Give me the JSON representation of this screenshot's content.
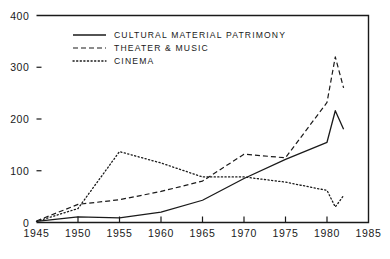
{
  "chart_data": {
    "type": "line",
    "title": "",
    "xlabel": "",
    "ylabel": "",
    "xlim": [
      1945,
      1985
    ],
    "ylim": [
      0,
      400
    ],
    "grid": false,
    "legend_position": "top-left-inside",
    "x_ticks": [
      "1945",
      "1950",
      "1955",
      "1960",
      "1965",
      "1970",
      "1975",
      "1980",
      "1985"
    ],
    "y_ticks": [
      "0",
      "100",
      "200",
      "300",
      "400"
    ],
    "x": [
      1945,
      1950,
      1955,
      1960,
      1965,
      1970,
      1975,
      1980,
      1981,
      1982
    ],
    "series": [
      {
        "name": "CULTURAL MATERIAL PATRIMONY",
        "style": "solid",
        "color": "#1a1a1a",
        "values": [
          2,
          11,
          9,
          20,
          43,
          85,
          122,
          155,
          216,
          180
        ]
      },
      {
        "name": "THEATER & MUSIC",
        "style": "dashed",
        "color": "#1a1a1a",
        "values": [
          3,
          35,
          44,
          60,
          80,
          132,
          125,
          232,
          320,
          260
        ]
      },
      {
        "name": "CINEMA",
        "style": "dotted",
        "color": "#1a1a1a",
        "values": [
          2,
          27,
          137,
          115,
          88,
          88,
          78,
          62,
          30,
          52
        ]
      }
    ]
  },
  "legend": {
    "entries": [
      {
        "label": "CULTURAL MATERIAL PATRIMONY",
        "style": "solid"
      },
      {
        "label": "THEATER & MUSIC",
        "style": "dashed"
      },
      {
        "label": "CINEMA",
        "style": "dotted"
      }
    ]
  },
  "axes": {
    "y_labels": [
      "400",
      "300",
      "200",
      "100",
      "0"
    ],
    "x_labels": [
      "1945",
      "1950",
      "1955",
      "1960",
      "1965",
      "1970",
      "1975",
      "1980",
      "1985"
    ]
  }
}
